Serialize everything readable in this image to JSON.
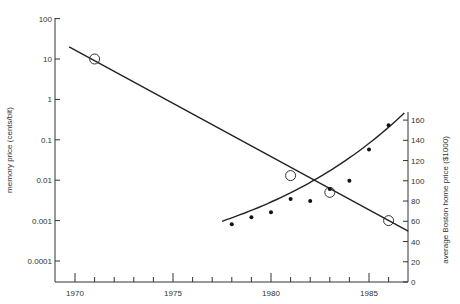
{
  "chart_data": {
    "type": "line",
    "title": "",
    "xlabel": "",
    "ylabel": "memory price (cents/bit)",
    "y2label": "average Boston home price ($1000)",
    "xlim": [
      1967,
      1987
    ],
    "ylim": [
      5e-05,
      100
    ],
    "y_scale": "log",
    "y2lim": [
      0,
      160
    ],
    "x_ticks": [
      1970,
      1975,
      1980,
      1985
    ],
    "y_ticks": [
      "100",
      "10",
      "1",
      "0.1",
      "0.01",
      "0.001",
      "0.0001"
    ],
    "y2_ticks": [
      "0",
      "20",
      "40",
      "60",
      "80",
      "100",
      "120",
      "140",
      "160"
    ],
    "grid": false,
    "legend": null,
    "series": [
      {
        "name": "memory price",
        "axis": "left",
        "marker": "open-circle",
        "x": [
          1971,
          1981,
          1983,
          1986
        ],
        "values": [
          10,
          0.013,
          0.005,
          0.001
        ],
        "fit_line": {
          "type": "log-linear",
          "x": [
            1969.7,
            1987
          ],
          "values": [
            20,
            0.00055
          ]
        }
      },
      {
        "name": "average Boston home price",
        "axis": "right",
        "marker": "filled-dot",
        "x": [
          1978,
          1979,
          1980,
          1981,
          1982,
          1983,
          1984,
          1985,
          1986
        ],
        "values": [
          57,
          64,
          69,
          82,
          80,
          92,
          100,
          131,
          155
        ],
        "fit_line": {
          "type": "exponential",
          "x": [
            1977.5,
            1986.8
          ],
          "values": [
            60,
            167
          ]
        }
      }
    ]
  }
}
